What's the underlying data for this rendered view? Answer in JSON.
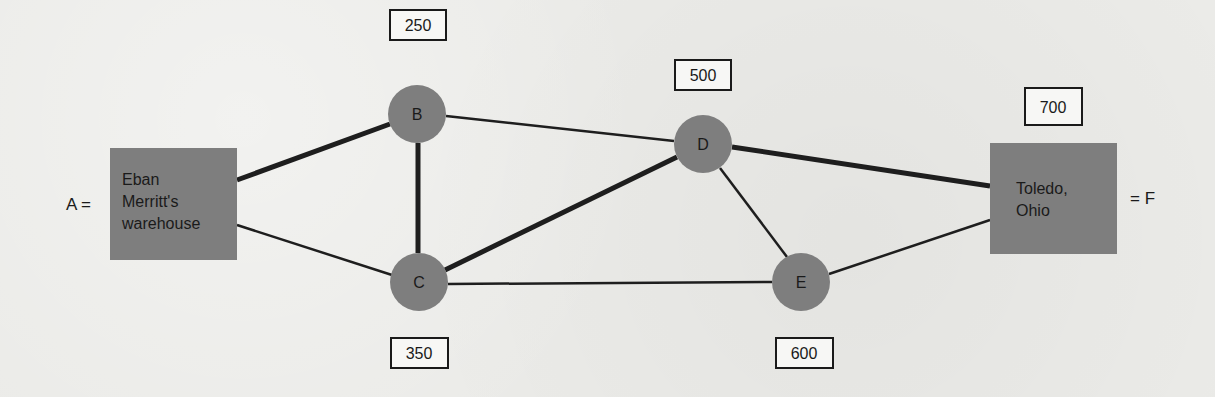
{
  "diagram": {
    "type": "network-shortest-route",
    "colors": {
      "node_fill": "#7e7e7e",
      "edge": "#1e1e1e",
      "label_box_border": "#1a1a1a",
      "label_box_fill": "#f7f7f5",
      "background": "#ebebe8"
    },
    "nodes": [
      {
        "id": "A",
        "shape": "rect",
        "lines": [
          "Eban",
          "Merritt's",
          "warehouse"
        ],
        "side_label": "A =",
        "cx": 173,
        "cy": 204,
        "w": 127,
        "h": 112
      },
      {
        "id": "B",
        "shape": "circle",
        "label": "B",
        "cx": 417,
        "cy": 114,
        "r": 29,
        "value": "250"
      },
      {
        "id": "C",
        "shape": "circle",
        "label": "C",
        "cx": 419,
        "cy": 282,
        "r": 29,
        "value": "350"
      },
      {
        "id": "D",
        "shape": "circle",
        "label": "D",
        "cx": 703,
        "cy": 144,
        "r": 29,
        "value": "500"
      },
      {
        "id": "E",
        "shape": "circle",
        "label": "E",
        "cx": 801,
        "cy": 282,
        "r": 29,
        "value": "600"
      },
      {
        "id": "F",
        "shape": "rect",
        "lines": [
          "Toledo,",
          "Ohio"
        ],
        "side_label": "= F",
        "cx": 1053,
        "cy": 198,
        "w": 127,
        "h": 111,
        "value": "700"
      }
    ],
    "value_boxes": [
      {
        "node": "B",
        "text": "250",
        "x": 390,
        "y": 10,
        "w": 56,
        "h": 30
      },
      {
        "node": "D",
        "text": "500",
        "x": 675,
        "y": 60,
        "w": 56,
        "h": 30
      },
      {
        "node": "F",
        "text": "700",
        "x": 1025,
        "y": 88,
        "w": 57,
        "h": 37
      },
      {
        "node": "C",
        "text": "350",
        "x": 391,
        "y": 338,
        "w": 57,
        "h": 30
      },
      {
        "node": "E",
        "text": "600",
        "x": 776,
        "y": 338,
        "w": 57,
        "h": 30
      }
    ],
    "edges": [
      {
        "from": "A",
        "to": "B",
        "bold": true,
        "x1": 237,
        "y1": 180,
        "x2": 390,
        "y2": 124
      },
      {
        "from": "A",
        "to": "C",
        "bold": false,
        "x1": 237,
        "y1": 225,
        "x2": 392,
        "y2": 275
      },
      {
        "from": "B",
        "to": "C",
        "bold": true,
        "x1": 418,
        "y1": 143,
        "x2": 418,
        "y2": 253
      },
      {
        "from": "B",
        "to": "D",
        "bold": false,
        "x1": 446,
        "y1": 116,
        "x2": 674,
        "y2": 141
      },
      {
        "from": "C",
        "to": "D",
        "bold": true,
        "x1": 445,
        "y1": 270,
        "x2": 677,
        "y2": 157
      },
      {
        "from": "C",
        "to": "E",
        "bold": false,
        "x1": 448,
        "y1": 284,
        "x2": 772,
        "y2": 282
      },
      {
        "from": "D",
        "to": "E",
        "bold": false,
        "x1": 720,
        "y1": 168,
        "x2": 787,
        "y2": 257
      },
      {
        "from": "D",
        "to": "F",
        "bold": true,
        "x1": 732,
        "y1": 147,
        "x2": 990,
        "y2": 186
      },
      {
        "from": "E",
        "to": "F",
        "bold": false,
        "x1": 829,
        "y1": 274,
        "x2": 990,
        "y2": 220
      }
    ],
    "labels": {
      "A_side": "A =",
      "F_side": "= F",
      "B": "B",
      "C": "C",
      "D": "D",
      "E": "E",
      "A_line1": "Eban",
      "A_line2": "Merritt's",
      "A_line3": "warehouse",
      "F_line1": "Toledo,",
      "F_line2": "Ohio",
      "val_B": "250",
      "val_D": "500",
      "val_F": "700",
      "val_C": "350",
      "val_E": "600"
    }
  }
}
